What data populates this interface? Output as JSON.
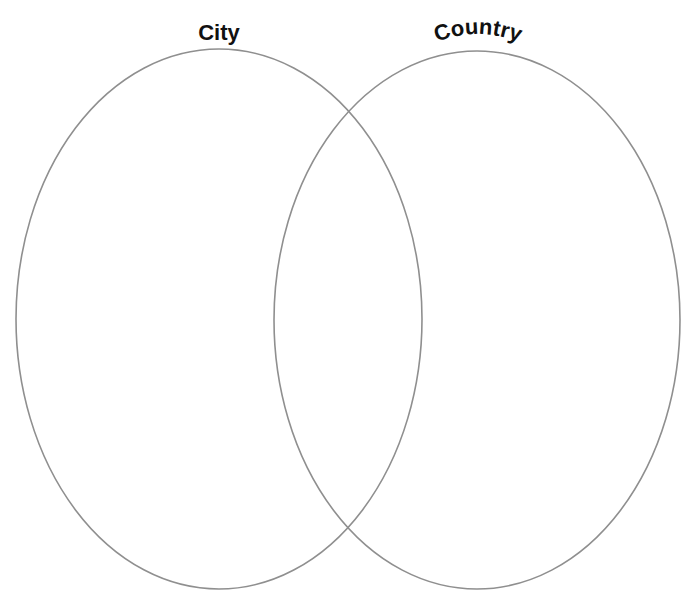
{
  "diagram": {
    "type": "venn",
    "sets": [
      {
        "label": "City",
        "cx": 219,
        "cy": 319,
        "rx": 203,
        "ry": 270
      },
      {
        "label": "Country",
        "cx": 477,
        "cy": 320,
        "rx": 203,
        "ry": 269
      }
    ],
    "regions": {
      "city_only": "",
      "both": "",
      "country_only": ""
    },
    "colors": {
      "outline": "#8f8f8f",
      "label": "#111111",
      "background": "#ffffff"
    }
  }
}
